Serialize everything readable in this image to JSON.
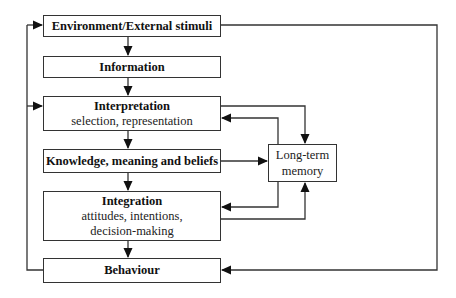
{
  "diagram": {
    "type": "flowchart",
    "colors": {
      "line": "#333333",
      "box_border": "#333333",
      "background": "#ffffff"
    },
    "boxes": [
      {
        "id": "environment",
        "title": "Environment/External stimuli",
        "subtitle": ""
      },
      {
        "id": "information",
        "title": "Information",
        "subtitle": ""
      },
      {
        "id": "interpretation",
        "title": "Interpretation",
        "subtitle": "selection, representation"
      },
      {
        "id": "knowledge",
        "title": "Knowledge, meaning and beliefs",
        "subtitle": ""
      },
      {
        "id": "integration",
        "title": "Integration",
        "subtitle_line1": "attitudes, intentions,",
        "subtitle_line2": "decision-making"
      },
      {
        "id": "behaviour",
        "title": "Behaviour",
        "subtitle": ""
      }
    ],
    "memory": {
      "line1": "Long-term",
      "line2": "memory"
    },
    "edges": [
      {
        "from": "environment",
        "to": "information"
      },
      {
        "from": "information",
        "to": "interpretation"
      },
      {
        "from": "interpretation",
        "to": "knowledge"
      },
      {
        "from": "knowledge",
        "to": "integration"
      },
      {
        "from": "integration",
        "to": "behaviour"
      },
      {
        "from": "behaviour",
        "to": "environment",
        "route": "left loop"
      },
      {
        "from": "behaviour",
        "to": "interpretation",
        "route": "left loop"
      },
      {
        "from": "environment",
        "to": "behaviour",
        "route": "right loop"
      },
      {
        "from": "interpretation",
        "to": "memory"
      },
      {
        "from": "memory",
        "to": "interpretation"
      },
      {
        "from": "knowledge",
        "to": "memory"
      },
      {
        "from": "memory",
        "to": "integration"
      },
      {
        "from": "integration",
        "to": "memory"
      }
    ]
  }
}
